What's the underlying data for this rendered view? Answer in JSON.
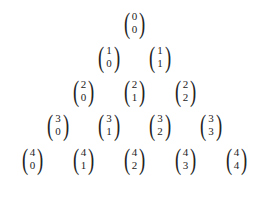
{
  "figure": {
    "name": "pascals-triangle-binomial-coefficients",
    "background_color": "#ffffff",
    "text_color": "#1c1c1c",
    "rows_count": 5
  },
  "chart_data": {
    "type": "table",
    "title": "",
    "xlabel": "",
    "ylabel": "",
    "notation": "binomial coefficient (n choose k)",
    "rows": [
      {
        "n": "0",
        "entries": [
          {
            "n": "0",
            "k": "0"
          }
        ]
      },
      {
        "n": "1",
        "entries": [
          {
            "n": "1",
            "k": "0"
          },
          {
            "n": "1",
            "k": "1"
          }
        ]
      },
      {
        "n": "2",
        "entries": [
          {
            "n": "2",
            "k": "0"
          },
          {
            "n": "2",
            "k": "1"
          },
          {
            "n": "2",
            "k": "2"
          }
        ]
      },
      {
        "n": "3",
        "entries": [
          {
            "n": "3",
            "k": "0"
          },
          {
            "n": "3",
            "k": "1"
          },
          {
            "n": "3",
            "k": "2"
          },
          {
            "n": "3",
            "k": "3"
          }
        ]
      },
      {
        "n": "4",
        "entries": [
          {
            "n": "4",
            "k": "0"
          },
          {
            "n": "4",
            "k": "1"
          },
          {
            "n": "4",
            "k": "2"
          },
          {
            "n": "4",
            "k": "3"
          },
          {
            "n": "4",
            "k": "4"
          }
        ]
      }
    ]
  },
  "glyphs": {
    "paren_left": "(",
    "paren_right": ")"
  }
}
